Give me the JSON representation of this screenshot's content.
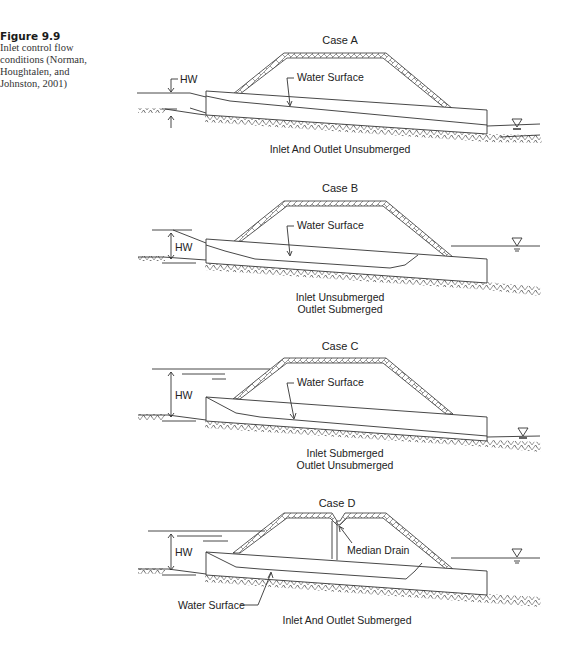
{
  "caption": {
    "figure_number": "Figure 9.9",
    "text_lines": [
      "Inlet control flow",
      "conditions (Norman,",
      "Houghtalen, and",
      "Johnston, 2001)"
    ]
  },
  "cases": [
    {
      "title": "Case A",
      "hw_label": "HW",
      "water_surface_label": "Water Surface",
      "condition_lines": [
        "Inlet And Outlet Unsubmerged"
      ]
    },
    {
      "title": "Case B",
      "hw_label": "HW",
      "water_surface_label": "Water Surface",
      "condition_lines": [
        "Inlet Unsubmerged",
        "Outlet Submerged"
      ]
    },
    {
      "title": "Case C",
      "hw_label": "HW",
      "water_surface_label": "Water Surface",
      "condition_lines": [
        "Inlet Submerged",
        "Outlet Unsubmerged"
      ]
    },
    {
      "title": "Case D",
      "hw_label": "HW",
      "water_surface_label": "Water Surface",
      "median_drain_label": "Median Drain",
      "condition_lines": [
        "Inlet And Outlet Submerged"
      ]
    }
  ],
  "colors": {
    "line": "#333333",
    "text": "#222222",
    "background": "#ffffff"
  }
}
